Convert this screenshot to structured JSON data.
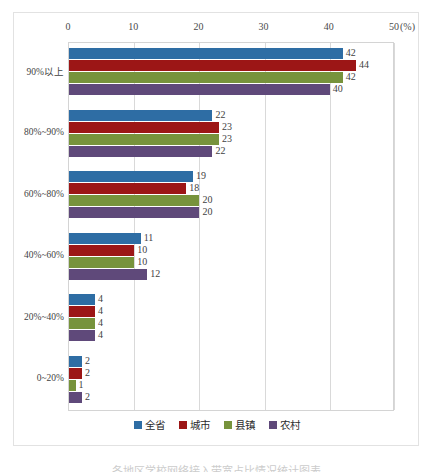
{
  "chart_data": {
    "type": "bar",
    "orientation": "horizontal",
    "title": "",
    "subtitle": "",
    "xlabel": "(%)",
    "ylabel": "",
    "xlim": [
      0,
      50
    ],
    "xticks": [
      "0",
      "10",
      "20",
      "30",
      "40",
      "50"
    ],
    "unit": "(%)",
    "grid": true,
    "legend_position": "bottom",
    "categories": [
      "90%以上",
      "80%~90%",
      "60%~80%",
      "40%~60%",
      "20%~40%",
      "0~20%"
    ],
    "series": [
      {
        "name": "全省",
        "color": "#2E6DA4",
        "values": [
          42,
          22,
          19,
          11,
          4,
          2
        ]
      },
      {
        "name": "城市",
        "color": "#9C1616",
        "values": [
          44,
          23,
          18,
          10,
          4,
          2
        ]
      },
      {
        "name": "县镇",
        "color": "#77933C",
        "values": [
          42,
          23,
          20,
          10,
          4,
          1
        ]
      },
      {
        "name": "农村",
        "color": "#5F497A",
        "values": [
          40,
          22,
          20,
          12,
          4,
          2
        ]
      }
    ]
  },
  "legend": {
    "items": [
      {
        "label": "全省",
        "color": "#2E6DA4"
      },
      {
        "label": "城市",
        "color": "#9C1616"
      },
      {
        "label": "县镇",
        "color": "#77933C"
      },
      {
        "label": "农村",
        "color": "#5F497A"
      }
    ]
  },
  "caption": {
    "text": "各地区学校网络接入带宽占比情况统计图表"
  }
}
